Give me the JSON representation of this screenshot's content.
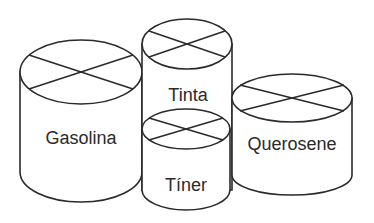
{
  "diagram": {
    "type": "cylinders",
    "stroke_color": "#2a2a2a",
    "background": "#ffffff",
    "containers": [
      {
        "id": "gasolina",
        "label": "Gasolina"
      },
      {
        "id": "tinta",
        "label": "Tinta"
      },
      {
        "id": "tiner",
        "label": "Tíner"
      },
      {
        "id": "querosene",
        "label": "Querosene"
      }
    ]
  }
}
